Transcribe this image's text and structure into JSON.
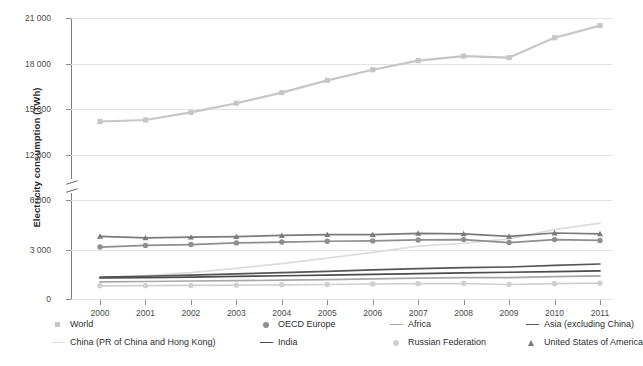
{
  "chart_data": {
    "type": "line",
    "title": "",
    "xlabel": "",
    "ylabel": "Electricity consumption (TWh)",
    "x": [
      2000,
      2001,
      2002,
      2003,
      2004,
      2005,
      2006,
      2007,
      2008,
      2009,
      2010,
      2011
    ],
    "categories": [
      "2000",
      "2001",
      "2002",
      "2003",
      "2004",
      "2005",
      "2006",
      "2007",
      "2008",
      "2009",
      "2010",
      "2011"
    ],
    "ylim": [
      0,
      21000
    ],
    "yticks": [
      0,
      3000,
      6000,
      12000,
      15000,
      18000,
      21000
    ],
    "ytick_labels": [
      "0",
      "3 000",
      "6 000",
      "12 000",
      "15 000",
      "18 000",
      "21 000"
    ],
    "axis_break": {
      "present": true,
      "between": [
        6000,
        12000
      ]
    },
    "grid": "horizontal",
    "legend_position": "bottom",
    "series": [
      {
        "name": "World",
        "marker": "square",
        "color": "#c6c6c6",
        "values": [
          14200,
          14300,
          14800,
          15400,
          16100,
          16900,
          17600,
          18200,
          18500,
          18400,
          19700,
          20500
        ]
      },
      {
        "name": "OECD Europe",
        "marker": "circle",
        "color": "#8e8e8e",
        "values": [
          3150,
          3250,
          3300,
          3400,
          3450,
          3500,
          3520,
          3580,
          3600,
          3420,
          3600,
          3550
        ]
      },
      {
        "name": "Africa",
        "marker": "line",
        "color": "#a8a8a8",
        "values": [
          1040,
          1060,
          1090,
          1110,
          1140,
          1180,
          1220,
          1260,
          1290,
          1300,
          1360,
          1400
        ]
      },
      {
        "name": "Asia (excluding China)",
        "marker": "line-dark",
        "color": "#555555",
        "values": [
          1320,
          1380,
          1450,
          1520,
          1600,
          1680,
          1760,
          1840,
          1900,
          1940,
          2040,
          2120
        ]
      },
      {
        "name": "China (PR of China and Hong Kong)",
        "marker": "line-light",
        "color": "#dcdcdc",
        "values": [
          1280,
          1420,
          1600,
          1860,
          2150,
          2480,
          2830,
          3200,
          3380,
          3640,
          4200,
          4600
        ]
      },
      {
        "name": "India",
        "marker": "line-dark2",
        "color": "#4c4c4c",
        "values": [
          1280,
          1300,
          1330,
          1370,
          1410,
          1450,
          1490,
          1540,
          1580,
          1620,
          1660,
          1700
        ]
      },
      {
        "name": "Russian Federation",
        "marker": "circle-light",
        "color": "#d0d0d0",
        "values": [
          800,
          810,
          820,
          840,
          860,
          880,
          910,
          930,
          940,
          880,
          930,
          960
        ]
      },
      {
        "name": "United States of America",
        "marker": "triangle",
        "color": "#7a7a7a",
        "values": [
          3800,
          3700,
          3750,
          3780,
          3850,
          3900,
          3900,
          3980,
          3950,
          3800,
          4000,
          3950
        ]
      }
    ]
  },
  "axis": {
    "y_title": "Electricity consumption (TWh)",
    "y_tick_labels": [
      "21 000",
      "18 000",
      "15 000",
      "12 000",
      "6 000",
      "3 000",
      "0"
    ],
    "x_tick_labels": [
      "2000",
      "2001",
      "2002",
      "2003",
      "2004",
      "2005",
      "2006",
      "2007",
      "2008",
      "2009",
      "2010",
      "2011"
    ]
  },
  "legend": {
    "row1": [
      {
        "label": "World",
        "marker": "square",
        "color": "#c6c6c6"
      },
      {
        "label": "OECD Europe",
        "marker": "circle",
        "color": "#8e8e8e"
      },
      {
        "label": "Africa",
        "marker": "line",
        "color": "#a8a8a8"
      },
      {
        "label": "Asia (excluding China)",
        "marker": "line",
        "color": "#555555"
      }
    ],
    "row2": [
      {
        "label": "China (PR of China and Hong Kong)",
        "marker": "line",
        "color": "#dcdcdc"
      },
      {
        "label": "India",
        "marker": "line",
        "color": "#4c4c4c"
      },
      {
        "label": "Russian Federation",
        "marker": "circle",
        "color": "#d0d0d0"
      },
      {
        "label": "United States of America",
        "marker": "triangle",
        "color": "#7a7a7a"
      }
    ]
  }
}
